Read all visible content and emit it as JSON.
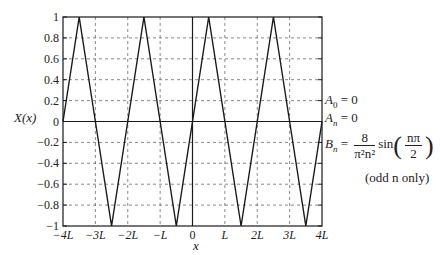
{
  "chart_data": {
    "type": "line",
    "title": "",
    "xlabel": "x",
    "ylabel": "X(x)",
    "xlim": [
      -4,
      4
    ],
    "ylim": [
      -1,
      1
    ],
    "x_unit": "L",
    "x_ticks": [
      -4,
      -3,
      -2,
      -1,
      0,
      1,
      2,
      3,
      4
    ],
    "x_tick_labels": [
      "-4L",
      "-3L",
      "-2L",
      "-L",
      "0",
      "L",
      "2L",
      "3L",
      "4L"
    ],
    "y_ticks": [
      -1,
      -0.8,
      -0.6,
      -0.4,
      -0.2,
      0,
      0.2,
      0.4,
      0.6,
      0.8,
      1
    ],
    "y_tick_labels": [
      "-1",
      "-0.8",
      "-0.6",
      "-0.4",
      "-0.2",
      "0",
      "0.2",
      "0.4",
      "0.6",
      "0.8",
      "1"
    ],
    "grid": true,
    "grid_style": "dashed",
    "series": [
      {
        "name": "X(x) triangle wave",
        "x": [
          -4,
          -3.5,
          -2.5,
          -1.5,
          -0.5,
          0.5,
          1.5,
          2.5,
          3.5,
          4
        ],
        "y": [
          0,
          1,
          -1,
          1,
          -1,
          1,
          -1,
          1,
          -1,
          0
        ]
      }
    ],
    "annotations": [
      {
        "text": "A_0 = 0",
        "position": "right, y=0.2"
      },
      {
        "text": "A_n = 0",
        "position": "right, y=0"
      },
      {
        "text": "B_n = 8/(π^2 n^2) sin(nπ/2)",
        "position": "right, y≈-0.3"
      },
      {
        "text": "(odd n only)",
        "position": "right, y≈-0.5"
      }
    ],
    "colors": {
      "line": "#1a1a1a",
      "grid": "#555555",
      "frame": "#1a1a1a"
    }
  },
  "labels": {
    "ylabel": "X(x)",
    "xlabel": "x"
  },
  "annotations": {
    "a0_symbol": "A",
    "a0_sub": "0",
    "a0_rest": " = 0",
    "an_symbol": "A",
    "an_sub": "n",
    "an_rest": " = 0",
    "bn_symbol": "B",
    "bn_sub": "n",
    "bn_eq": " = ",
    "bn_num": "8",
    "bn_den": "π²n²",
    "bn_sin": "sin",
    "bn_inner_num": "nπ",
    "bn_inner_den": "2",
    "bn_note": "(odd n only)"
  }
}
